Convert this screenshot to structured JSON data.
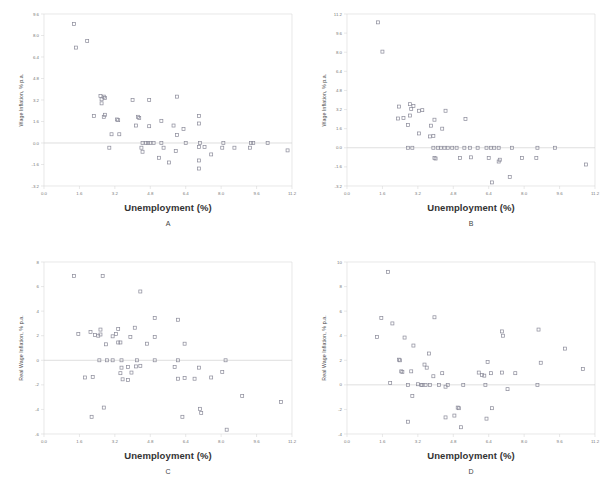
{
  "figure": {
    "panel_count": 4,
    "marker_style": "open-square",
    "marker_color": "#8a8a99",
    "frame_color": "#d9d9d9",
    "zero_line_color": "#d0d0d0",
    "tick_label_color": "#777777",
    "background": "#ffffff"
  },
  "chart_data": [
    {
      "type": "scatter",
      "panel": "A",
      "title": "",
      "xlabel": "Unemployment (%)",
      "ylabel": "Wage Inflation, % p.a.",
      "xlim": [
        0.0,
        11.2
      ],
      "ylim": [
        -3.2,
        9.6
      ],
      "xticks": [
        0.0,
        1.6,
        3.2,
        4.8,
        6.4,
        8.0,
        9.6,
        11.2
      ],
      "xtick_labels": [
        "0.0",
        "1.6",
        "3.2",
        "4.8",
        "6.4",
        "8.0",
        "9.6",
        "11.2"
      ],
      "yticks": [
        -3.2,
        -1.6,
        0.0,
        1.6,
        3.2,
        4.8,
        6.4,
        8.0,
        9.6
      ],
      "ytick_labels": [
        "-3.2",
        "-1.6",
        "0.0",
        "1.6",
        "3.2",
        "4.8",
        "6.4",
        "8.0",
        "9.6"
      ],
      "grid": false,
      "zero_line": 0.0,
      "legend": "none",
      "points": [
        [
          1.35,
          8.85
        ],
        [
          1.45,
          7.1
        ],
        [
          1.95,
          7.6
        ],
        [
          2.55,
          3.5
        ],
        [
          2.6,
          3.25
        ],
        [
          2.75,
          3.35
        ],
        [
          2.7,
          3.45
        ],
        [
          2.6,
          2.95
        ],
        [
          4.0,
          3.2
        ],
        [
          4.75,
          3.2
        ],
        [
          6.0,
          3.45
        ],
        [
          2.25,
          2.0
        ],
        [
          2.75,
          2.1
        ],
        [
          2.7,
          1.95
        ],
        [
          3.3,
          1.75
        ],
        [
          3.35,
          1.7
        ],
        [
          4.25,
          1.95
        ],
        [
          4.3,
          1.85
        ],
        [
          5.3,
          1.65
        ],
        [
          7.0,
          2.0
        ],
        [
          7.0,
          1.45
        ],
        [
          4.15,
          1.3
        ],
        [
          4.75,
          1.25
        ],
        [
          5.85,
          1.3
        ],
        [
          6.3,
          1.05
        ],
        [
          3.05,
          0.65
        ],
        [
          3.4,
          0.65
        ],
        [
          6.0,
          0.6
        ],
        [
          4.45,
          0.0
        ],
        [
          4.6,
          0.0
        ],
        [
          4.7,
          0.0
        ],
        [
          4.8,
          0.0
        ],
        [
          4.95,
          0.0
        ],
        [
          5.3,
          0.0
        ],
        [
          6.4,
          0.0
        ],
        [
          7.05,
          0.0
        ],
        [
          8.1,
          0.0
        ],
        [
          9.35,
          0.0
        ],
        [
          9.45,
          0.0
        ],
        [
          10.1,
          0.0
        ],
        [
          2.95,
          -0.35
        ],
        [
          4.4,
          -0.35
        ],
        [
          5.4,
          -0.35
        ],
        [
          7.0,
          -0.3
        ],
        [
          7.25,
          -0.3
        ],
        [
          8.05,
          -0.35
        ],
        [
          8.6,
          -0.35
        ],
        [
          9.3,
          -0.35
        ],
        [
          11.0,
          -0.55
        ],
        [
          4.45,
          -0.65
        ],
        [
          5.95,
          -0.6
        ],
        [
          7.55,
          -0.85
        ],
        [
          5.2,
          -1.1
        ],
        [
          7.0,
          -1.3
        ],
        [
          5.65,
          -1.45
        ],
        [
          7.0,
          -1.9
        ]
      ]
    },
    {
      "type": "scatter",
      "panel": "B",
      "title": "",
      "xlabel": "Unemployment (%)",
      "ylabel": "Wage Inflation, % p.a.",
      "xlim": [
        0.0,
        11.2
      ],
      "ylim": [
        -3.2,
        11.2
      ],
      "xticks": [
        0.0,
        1.6,
        3.2,
        4.8,
        6.4,
        8.0,
        9.6,
        11.2
      ],
      "xtick_labels": [
        "0.0",
        "1.6",
        "3.2",
        "4.8",
        "6.4",
        "8.0",
        "9.6",
        "11.2"
      ],
      "yticks": [
        -3.2,
        -1.6,
        0.0,
        1.6,
        3.2,
        4.8,
        6.4,
        8.0,
        9.6,
        11.2
      ],
      "ytick_labels": [
        "-3.2",
        "-1.6",
        "0.0",
        "1.6",
        "3.2",
        "4.8",
        "6.4",
        "8.0",
        "9.6",
        "11.2"
      ],
      "grid": false,
      "zero_line": 0.0,
      "legend": "none",
      "points": [
        [
          1.4,
          10.5
        ],
        [
          1.6,
          8.05
        ],
        [
          2.35,
          3.45
        ],
        [
          2.85,
          3.65
        ],
        [
          3.0,
          3.5
        ],
        [
          2.9,
          3.25
        ],
        [
          3.25,
          3.1
        ],
        [
          3.4,
          3.15
        ],
        [
          4.45,
          3.1
        ],
        [
          2.3,
          2.45
        ],
        [
          2.55,
          2.5
        ],
        [
          2.85,
          2.7
        ],
        [
          3.95,
          2.35
        ],
        [
          5.35,
          2.4
        ],
        [
          2.75,
          1.9
        ],
        [
          3.8,
          1.85
        ],
        [
          4.3,
          1.6
        ],
        [
          3.25,
          1.2
        ],
        [
          3.75,
          0.95
        ],
        [
          3.9,
          1.0
        ],
        [
          2.75,
          0.0
        ],
        [
          2.95,
          0.0
        ],
        [
          3.9,
          0.0
        ],
        [
          4.1,
          0.0
        ],
        [
          4.25,
          0.0
        ],
        [
          4.4,
          0.0
        ],
        [
          4.55,
          0.0
        ],
        [
          4.75,
          0.0
        ],
        [
          4.95,
          0.0
        ],
        [
          5.3,
          0.0
        ],
        [
          5.55,
          0.0
        ],
        [
          5.9,
          0.0
        ],
        [
          6.3,
          0.0
        ],
        [
          6.5,
          0.0
        ],
        [
          6.65,
          0.0
        ],
        [
          6.85,
          0.0
        ],
        [
          7.45,
          0.0
        ],
        [
          8.6,
          0.0
        ],
        [
          9.4,
          0.0
        ],
        [
          3.95,
          -0.85
        ],
        [
          4.0,
          -0.9
        ],
        [
          5.1,
          -0.85
        ],
        [
          5.6,
          -0.8
        ],
        [
          6.4,
          -0.85
        ],
        [
          6.9,
          -1.0
        ],
        [
          7.9,
          -0.85
        ],
        [
          8.55,
          -0.85
        ],
        [
          6.85,
          -1.15
        ],
        [
          10.8,
          -1.4
        ],
        [
          6.55,
          -2.9
        ],
        [
          7.35,
          -2.45
        ]
      ]
    },
    {
      "type": "scatter",
      "panel": "C",
      "title": "",
      "xlabel": "Unemployment (%)",
      "ylabel": "Real Wage Inflation, % p.a.",
      "xlim": [
        0.0,
        11.2
      ],
      "ylim": [
        -6,
        8
      ],
      "xticks": [
        0.0,
        1.6,
        3.2,
        4.8,
        6.4,
        8.0,
        9.6,
        11.2
      ],
      "xtick_labels": [
        "0.0",
        "1.6",
        "3.2",
        "4.8",
        "6.4",
        "8.0",
        "9.6",
        "11.2"
      ],
      "yticks": [
        -6,
        -4,
        -2,
        0,
        2,
        4,
        6,
        8
      ],
      "ytick_labels": [
        "-6",
        "-4",
        "-2",
        "0",
        "2",
        "4",
        "6",
        "8"
      ],
      "grid": false,
      "zero_line": 0,
      "legend": "none",
      "points": [
        [
          1.35,
          6.85
        ],
        [
          2.65,
          6.85
        ],
        [
          4.35,
          5.6
        ],
        [
          5.0,
          3.45
        ],
        [
          6.05,
          3.3
        ],
        [
          1.55,
          2.15
        ],
        [
          2.1,
          2.3
        ],
        [
          2.55,
          2.5
        ],
        [
          3.35,
          2.55
        ],
        [
          4.1,
          2.65
        ],
        [
          2.3,
          2.05
        ],
        [
          2.45,
          2.0
        ],
        [
          2.55,
          2.1
        ],
        [
          3.1,
          1.95
        ],
        [
          3.25,
          2.15
        ],
        [
          3.9,
          1.9
        ],
        [
          5.0,
          1.9
        ],
        [
          2.8,
          1.3
        ],
        [
          3.35,
          1.45
        ],
        [
          3.45,
          1.45
        ],
        [
          4.65,
          1.35
        ],
        [
          6.35,
          1.35
        ],
        [
          2.5,
          0.0
        ],
        [
          2.85,
          0.0
        ],
        [
          3.1,
          0.0
        ],
        [
          3.5,
          0.0
        ],
        [
          4.2,
          0.0
        ],
        [
          5.0,
          0.0
        ],
        [
          6.05,
          0.0
        ],
        [
          8.2,
          0.0
        ],
        [
          3.5,
          -0.6
        ],
        [
          3.8,
          -0.55
        ],
        [
          4.15,
          -0.5
        ],
        [
          4.35,
          -0.45
        ],
        [
          5.9,
          -0.55
        ],
        [
          7.0,
          -0.6
        ],
        [
          3.45,
          -1.05
        ],
        [
          3.95,
          -1.0
        ],
        [
          8.05,
          -0.95
        ],
        [
          1.85,
          -1.4
        ],
        [
          2.2,
          -1.35
        ],
        [
          3.55,
          -1.55
        ],
        [
          3.8,
          -1.6
        ],
        [
          6.05,
          -1.5
        ],
        [
          6.35,
          -1.45
        ],
        [
          6.8,
          -1.5
        ],
        [
          7.55,
          -1.4
        ],
        [
          2.7,
          -3.85
        ],
        [
          8.95,
          -2.9
        ],
        [
          10.7,
          -3.4
        ],
        [
          2.15,
          -4.6
        ],
        [
          6.25,
          -4.6
        ],
        [
          7.05,
          -3.95
        ],
        [
          7.1,
          -4.3
        ],
        [
          8.25,
          -5.65
        ]
      ]
    },
    {
      "type": "scatter",
      "panel": "D",
      "title": "",
      "xlabel": "Unemployment (%)",
      "ylabel": "Real Wage Inflation, % p.a.",
      "xlim": [
        0.0,
        11.2
      ],
      "ylim": [
        -4,
        10
      ],
      "xticks": [
        0.0,
        1.6,
        3.2,
        4.8,
        6.4,
        8.0,
        9.6,
        11.2
      ],
      "xtick_labels": [
        "0.0",
        "1.6",
        "3.2",
        "4.8",
        "6.4",
        "8.0",
        "9.6",
        "11.2"
      ],
      "yticks": [
        -4,
        -2,
        0,
        2,
        4,
        6,
        8,
        10
      ],
      "ytick_labels": [
        "-4",
        "-2",
        "0",
        "2",
        "4",
        "6",
        "8",
        "10"
      ],
      "grid": false,
      "zero_line": 0,
      "legend": "none",
      "points": [
        [
          1.85,
          9.2
        ],
        [
          1.55,
          5.45
        ],
        [
          2.05,
          5.0
        ],
        [
          3.95,
          5.5
        ],
        [
          1.35,
          3.9
        ],
        [
          2.6,
          3.85
        ],
        [
          7.0,
          4.35
        ],
        [
          7.05,
          4.0
        ],
        [
          8.65,
          4.5
        ],
        [
          3.0,
          3.2
        ],
        [
          9.85,
          2.95
        ],
        [
          2.35,
          2.05
        ],
        [
          2.4,
          2.0
        ],
        [
          3.7,
          2.55
        ],
        [
          6.35,
          1.85
        ],
        [
          8.75,
          1.8
        ],
        [
          2.45,
          1.1
        ],
        [
          2.5,
          1.05
        ],
        [
          2.9,
          1.1
        ],
        [
          3.5,
          1.65
        ],
        [
          3.6,
          1.4
        ],
        [
          4.3,
          0.95
        ],
        [
          5.95,
          1.0
        ],
        [
          6.5,
          0.95
        ],
        [
          7.0,
          1.0
        ],
        [
          7.6,
          0.95
        ],
        [
          10.65,
          1.3
        ],
        [
          6.1,
          0.8
        ],
        [
          6.2,
          0.75
        ],
        [
          3.9,
          0.7
        ],
        [
          1.95,
          0.15
        ],
        [
          2.75,
          0.0
        ],
        [
          3.2,
          0.05
        ],
        [
          3.35,
          0.0
        ],
        [
          3.4,
          0.0
        ],
        [
          3.55,
          0.0
        ],
        [
          3.75,
          0.0
        ],
        [
          4.15,
          0.0
        ],
        [
          4.55,
          0.0
        ],
        [
          5.25,
          0.0
        ],
        [
          6.25,
          0.0
        ],
        [
          8.6,
          0.0
        ],
        [
          4.45,
          -0.15
        ],
        [
          7.25,
          -0.35
        ],
        [
          2.95,
          -0.9
        ],
        [
          5.0,
          -1.85
        ],
        [
          5.05,
          -1.9
        ],
        [
          6.55,
          -1.9
        ],
        [
          4.45,
          -2.65
        ],
        [
          4.85,
          -2.5
        ],
        [
          2.75,
          -3.0
        ],
        [
          6.3,
          -2.75
        ],
        [
          5.15,
          -3.45
        ]
      ]
    }
  ],
  "panels": [
    {
      "letter": "A",
      "xlabel": "Unemployment (%)",
      "ylabel": "Wage Inflation, % p.a."
    },
    {
      "letter": "B",
      "xlabel": "Unemployment (%)",
      "ylabel": "Wage Inflation, % p.a."
    },
    {
      "letter": "C",
      "xlabel": "Unemployment (%)",
      "ylabel": "Real Wage Inflation, % p.a."
    },
    {
      "letter": "D",
      "xlabel": "Unemployment (%)",
      "ylabel": "Real Wage Inflation, % p.a."
    }
  ]
}
